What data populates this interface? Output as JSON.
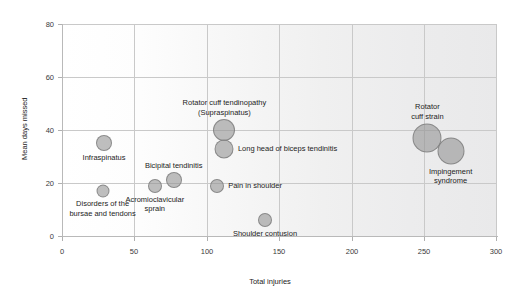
{
  "chart_data": {
    "type": "scatter",
    "title": "",
    "xlabel": "Total injuries",
    "ylabel": "Mean days missed",
    "xlim": [
      0,
      300
    ],
    "ylim": [
      0,
      80
    ],
    "xticks": [
      0,
      50,
      100,
      150,
      200,
      250,
      300
    ],
    "yticks": [
      0,
      20,
      40,
      60,
      80
    ],
    "grid": true,
    "legend": "none",
    "bubble_color": "#969696",
    "bubble_edge_color": "#787878",
    "grid_color": "#c9c9c9",
    "points": [
      {
        "label": "Infraspinatus",
        "x": 29,
        "y": 35,
        "size": 16,
        "label_pos": "below",
        "label_lines": [
          "Infraspinatus"
        ]
      },
      {
        "label": "Disorders of the bursae and tendons",
        "x": 28,
        "y": 17,
        "size": 13,
        "label_pos": "below",
        "label_lines": [
          "Disorders of the",
          "bursae and tendons"
        ]
      },
      {
        "label": "Acromioclavicular sprain",
        "x": 64,
        "y": 19,
        "size": 14,
        "label_pos": "below",
        "label_lines": [
          "Acromioclavicular",
          "sprain"
        ]
      },
      {
        "label": "Bicipital tendinitis",
        "x": 77,
        "y": 21,
        "size": 16,
        "label_pos": "above",
        "label_lines": [
          "Bicipital tendinitis"
        ]
      },
      {
        "label": "Rotator cuff tendinopathy (Supraspinatus)",
        "x": 112,
        "y": 40,
        "size": 22,
        "label_pos": "above",
        "label_lines": [
          "Rotator cuff tendinopathy",
          "(Supraspinatus)"
        ]
      },
      {
        "label": "Long head of biceps tendinitis",
        "x": 112,
        "y": 33,
        "size": 19,
        "label_pos": "right",
        "label_lines": [
          "Long head of biceps tendinitis"
        ]
      },
      {
        "label": "Pain in shoulder",
        "x": 107,
        "y": 19,
        "size": 14,
        "label_pos": "right",
        "label_lines": [
          "Pain in shoulder"
        ]
      },
      {
        "label": "Shoulder contusion",
        "x": 140,
        "y": 6,
        "size": 14,
        "label_pos": "below",
        "label_lines": [
          "Shoulder contusion"
        ]
      },
      {
        "label": "Rotator cuff strain",
        "x": 252,
        "y": 37,
        "size": 29,
        "label_pos": "above",
        "label_lines": [
          "Rotator",
          "cuff strain"
        ]
      },
      {
        "label": "Impingement syndrome",
        "x": 268,
        "y": 32,
        "size": 27,
        "label_pos": "below",
        "label_lines": [
          "Impingement",
          "syndrome"
        ]
      }
    ]
  },
  "axes": {
    "x_title": "Total injuries",
    "y_title": "Mean days missed",
    "x_tick_labels": [
      "0",
      "50",
      "100",
      "150",
      "200",
      "250",
      "300"
    ],
    "y_tick_labels": [
      "0",
      "20",
      "40",
      "60",
      "80"
    ]
  }
}
